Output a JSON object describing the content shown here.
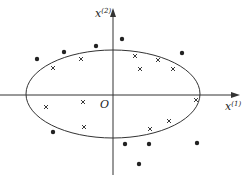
{
  "diagram": {
    "axes": {
      "x_label": "x",
      "x_sup": "(1)",
      "y_label": "x",
      "y_sup": "(2)",
      "origin_label": "O"
    },
    "ellipse": {
      "cx": 113,
      "cy": 94,
      "rx": 87,
      "ry": 44
    },
    "dots": [
      [
        37,
        59
      ],
      [
        64,
        52
      ],
      [
        96,
        46
      ],
      [
        122,
        39
      ],
      [
        182,
        53
      ],
      [
        53,
        132
      ],
      [
        125,
        144
      ],
      [
        149,
        144
      ],
      [
        197,
        143
      ],
      [
        139,
        164
      ]
    ],
    "crosses": [
      [
        53,
        68
      ],
      [
        81,
        59
      ],
      [
        135,
        56
      ],
      [
        158,
        60
      ],
      [
        140,
        69
      ],
      [
        173,
        69
      ],
      [
        196,
        100
      ],
      [
        46,
        107
      ],
      [
        83,
        102
      ],
      [
        84,
        127
      ],
      [
        150,
        129
      ],
      [
        169,
        121
      ]
    ],
    "colors": {
      "ink": "#222222",
      "background": "#ffffff"
    }
  }
}
